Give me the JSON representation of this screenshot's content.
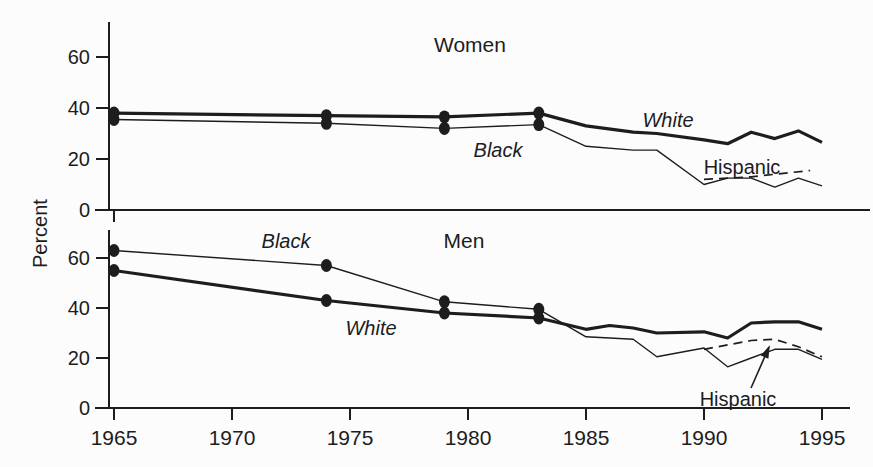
{
  "figure": {
    "ylabel": "Percent",
    "background_color": "#fcfcfc",
    "ink_color": "#1d1d1d"
  },
  "x_axis": {
    "tick_labels": [
      "1965",
      "1970",
      "1975",
      "1980",
      "1985",
      "1990",
      "1995"
    ],
    "tick_years": [
      1965,
      1970,
      1975,
      1980,
      1985,
      1990,
      1995
    ],
    "range": [
      1965,
      1995
    ]
  },
  "chart_data": [
    {
      "id": "women",
      "type": "line",
      "title": "Women",
      "ylabel": "Percent",
      "ylim": [
        0,
        70
      ],
      "y_ticks": [
        0,
        20,
        40,
        60
      ],
      "grid": false,
      "legend": "inline-labels",
      "series": [
        {
          "name": "White",
          "style": "thick",
          "marker_years": [
            1965,
            1974,
            1979,
            1983
          ],
          "x": [
            1965,
            1974,
            1979,
            1983,
            1985,
            1987,
            1988,
            1990,
            1991,
            1992,
            1993,
            1994,
            1995
          ],
          "y": [
            38,
            37,
            36.5,
            38,
            33,
            30.5,
            30,
            27.5,
            26,
            30.5,
            28,
            31,
            26.5
          ]
        },
        {
          "name": "Black",
          "style": "thin",
          "marker_years": [
            1965,
            1974,
            1979,
            1983
          ],
          "x": [
            1965,
            1974,
            1979,
            1983,
            1985,
            1987,
            1988,
            1990,
            1991,
            1992,
            1993,
            1994,
            1995
          ],
          "y": [
            35.5,
            34,
            32,
            33.5,
            25,
            23.5,
            23.5,
            10,
            12.5,
            12.5,
            9,
            12.5,
            9.5
          ]
        },
        {
          "name": "Hispanic",
          "style": "dashed",
          "marker_years": [],
          "x": [
            1990,
            1991,
            1992,
            1993,
            1994.5
          ],
          "y": [
            12,
            12.5,
            13,
            14,
            15.5
          ]
        }
      ],
      "annotations": [
        {
          "text": "White",
          "italic": true,
          "px": [
            668,
            127
          ]
        },
        {
          "text": "Black",
          "italic": true,
          "px": [
            498,
            157
          ]
        },
        {
          "text": "Hispanic",
          "italic": false,
          "px": [
            742,
            174
          ]
        }
      ]
    },
    {
      "id": "men",
      "type": "line",
      "title": "Men",
      "ylabel": "Percent",
      "ylim": [
        0,
        70
      ],
      "y_ticks": [
        0,
        20,
        40,
        60
      ],
      "grid": false,
      "legend": "inline-labels",
      "series": [
        {
          "name": "White",
          "style": "thick",
          "marker_years": [
            1965,
            1974,
            1979,
            1983
          ],
          "x": [
            1965,
            1974,
            1979,
            1983,
            1985,
            1986,
            1987,
            1988,
            1990,
            1991,
            1992,
            1993,
            1994,
            1995
          ],
          "y": [
            55,
            43,
            38,
            36,
            31.5,
            33,
            32,
            30,
            30.5,
            28,
            34,
            34.5,
            34.5,
            31.5
          ]
        },
        {
          "name": "Black",
          "style": "thin",
          "marker_years": [
            1965,
            1974,
            1979,
            1983
          ],
          "x": [
            1965,
            1974,
            1979,
            1983,
            1985,
            1987,
            1988,
            1990,
            1991,
            1992,
            1993,
            1994,
            1995
          ],
          "y": [
            63,
            57,
            42.5,
            39.5,
            28.5,
            27.5,
            20.5,
            24,
            16.5,
            20,
            23.5,
            23.5,
            19.5
          ]
        },
        {
          "name": "Hispanic",
          "style": "dashed",
          "marker_years": [],
          "x": [
            1990,
            1992,
            1993,
            1994,
            1995
          ],
          "y": [
            23.5,
            27,
            27.5,
            24.5,
            20.5
          ]
        }
      ],
      "annotations": [
        {
          "text": "Black",
          "italic": true,
          "px": [
            286,
            248
          ]
        },
        {
          "text": "White",
          "italic": true,
          "px": [
            371,
            335
          ]
        },
        {
          "text": "Hispanic",
          "italic": false,
          "px": [
            738,
            406
          ]
        }
      ],
      "arrow": {
        "from": [
          751,
          388
        ],
        "to": [
          769,
          347
        ]
      }
    }
  ]
}
